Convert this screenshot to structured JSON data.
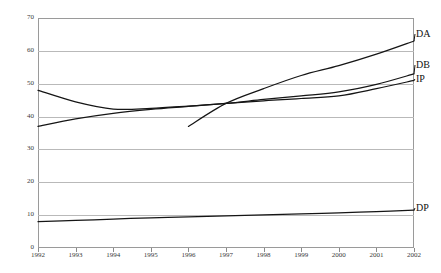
{
  "chart_data": {
    "type": "line",
    "title": "",
    "xlabel": "",
    "ylabel": "",
    "x": [
      1992,
      1993,
      1994,
      1995,
      1996,
      1997,
      1998,
      1999,
      2000,
      2001,
      2002
    ],
    "xtick_labels": [
      "1992",
      "1993",
      "1994",
      "1995",
      "1996",
      "1997",
      "1998",
      "1999",
      "2000",
      "2001",
      "2002"
    ],
    "ytick_labels": [
      "0",
      "10",
      "20",
      "30",
      "40",
      "50",
      "60",
      "70"
    ],
    "ylim": [
      0,
      70
    ],
    "ytick_step": 10,
    "xlim": [
      1992,
      2002
    ],
    "grid": true,
    "legend_position": "right-inline-labels",
    "line_color": "#151515",
    "grid_color": "#b9b9b9",
    "axis_color": "#9a9a9a",
    "series": [
      {
        "name": "DA",
        "label": "DA",
        "x": [
          1996,
          1997,
          1998,
          1999,
          2000,
          2001,
          2002
        ],
        "values": [
          37.0,
          44.0,
          48.5,
          52.5,
          55.5,
          59.0,
          63.0
        ]
      },
      {
        "name": "DB",
        "label": "DB",
        "x": [
          1992,
          1993,
          1994,
          1995,
          1996,
          1997,
          1998,
          1999,
          2000,
          2001,
          2002
        ],
        "values": [
          48.0,
          44.5,
          42.3,
          42.5,
          43.2,
          44.0,
          45.2,
          46.3,
          47.5,
          49.8,
          53.0
        ]
      },
      {
        "name": "IP",
        "label": "IP",
        "x": [
          1992,
          1993,
          1994,
          1995,
          1996,
          1997,
          1998,
          1999,
          2000,
          2001,
          2002
        ],
        "values": [
          37.0,
          39.3,
          41.0,
          42.2,
          43.1,
          44.0,
          44.8,
          45.5,
          46.3,
          48.5,
          51.0
        ]
      },
      {
        "name": "DP",
        "label": "DP",
        "x": [
          1992,
          1993,
          1994,
          1995,
          1996,
          1997,
          1998,
          1999,
          2000,
          2001,
          2002
        ],
        "values": [
          8.0,
          8.4,
          8.8,
          9.2,
          9.5,
          9.8,
          10.1,
          10.4,
          10.7,
          11.1,
          11.5
        ]
      }
    ],
    "series_label_anchors": [
      {
        "name": "DA",
        "left": 416,
        "top": 29
      },
      {
        "name": "DB",
        "left": 416,
        "top": 60
      },
      {
        "name": "IP",
        "left": 416,
        "top": 74
      },
      {
        "name": "DP",
        "left": 416,
        "top": 203
      }
    ]
  }
}
